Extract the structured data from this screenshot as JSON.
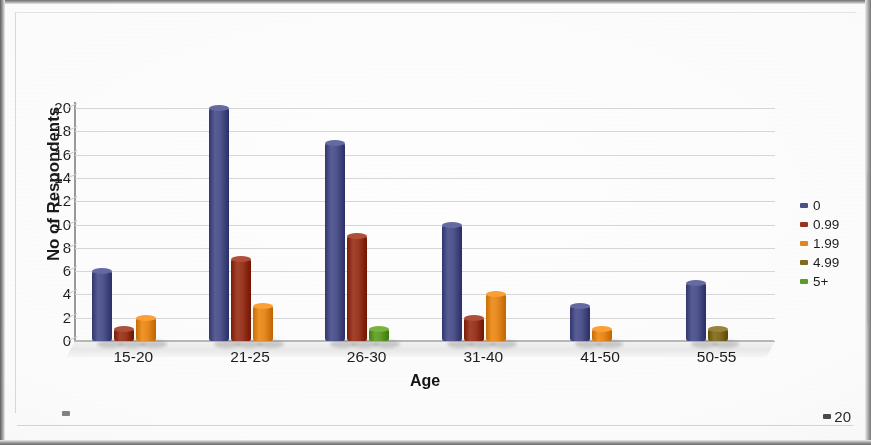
{
  "chart_data": {
    "type": "bar",
    "title": "",
    "xlabel": "Age",
    "ylabel": "No of Respondents",
    "categories": [
      "15-20",
      "21-25",
      "26-30",
      "31-40",
      "41-50",
      "50-55"
    ],
    "ylim": [
      0,
      20
    ],
    "ytick_labels": [
      "0",
      "2",
      "4",
      "6",
      "8",
      "10",
      "12",
      "14",
      "16",
      "18",
      "20"
    ],
    "ytick_values": [
      0,
      2,
      4,
      6,
      8,
      10,
      12,
      14,
      16,
      18,
      20
    ],
    "grid": true,
    "legend_position": "right",
    "three_d": true,
    "series": [
      {
        "name": "0",
        "color": "#4c5089",
        "values": [
          6,
          20,
          17,
          10,
          3,
          5
        ]
      },
      {
        "name": "0.99",
        "color": "#96351f",
        "values": [
          1,
          7,
          9,
          2,
          0,
          0
        ]
      },
      {
        "name": "1.99",
        "color": "#e3871c",
        "values": [
          2,
          3,
          0,
          4,
          1,
          0
        ]
      },
      {
        "name": "4.99",
        "color": "#7f6a1e",
        "values": [
          0,
          0,
          0,
          0,
          0,
          1
        ]
      },
      {
        "name": "5+",
        "color": "#5f9a27",
        "values": [
          0,
          0,
          1,
          0,
          0,
          0
        ]
      }
    ]
  },
  "legend": {
    "items": [
      {
        "label": "0",
        "color": "#4c5089"
      },
      {
        "label": "0.99",
        "color": "#96351f"
      },
      {
        "label": "1.99",
        "color": "#e3871c"
      },
      {
        "label": "4.99",
        "color": "#7f6a1e"
      },
      {
        "label": "5+",
        "color": "#5f9a27"
      }
    ]
  },
  "footer": {
    "page_number": "20"
  }
}
